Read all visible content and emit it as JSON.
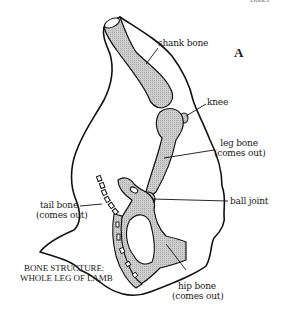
{
  "figure": {
    "letter": "A",
    "header_cut_text": "Bones",
    "caption_line1": "BONE STRUCTURE:",
    "caption_line2": "WHOLE LEG OF LAMB"
  },
  "labels": {
    "shank_bone": "shank bone",
    "knee": "knee",
    "leg_bone": "leg bone",
    "leg_bone_note": "(comes out)",
    "ball_joint": "ball joint",
    "tail_bone": "tail bone",
    "tail_bone_note": "(comes out)",
    "hip_bone": "hip bone",
    "hip_bone_note": "(comes out)"
  },
  "colors": {
    "outline": "#111111",
    "bone_fill": "#c8c8c8",
    "background": "#ffffff"
  }
}
